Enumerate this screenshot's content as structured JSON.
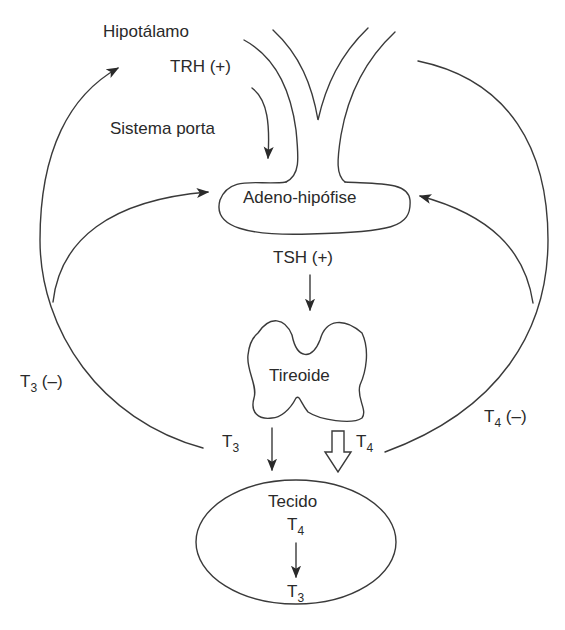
{
  "diagram": {
    "nodes": {
      "hypothalamus": {
        "label": "Hipotálamo"
      },
      "trh": {
        "label": "TRH (+)"
      },
      "portal_system": {
        "label": "Sistema porta"
      },
      "adenohypophysis": {
        "label": "Adeno-hipófise"
      },
      "tsh": {
        "label": "TSH (+)"
      },
      "thyroid": {
        "label": "Tireoide"
      },
      "tissue": {
        "label": "Tecido",
        "t4": {
          "base": "T",
          "sub": "4"
        },
        "t3": {
          "base": "T",
          "sub": "3"
        }
      }
    },
    "edges": {
      "t3_out": {
        "base": "T",
        "sub": "3"
      },
      "t4_out": {
        "base": "T",
        "sub": "4"
      },
      "t3_feedback": {
        "base": "T",
        "sub": "3",
        "sign": " (–)"
      },
      "t4_feedback": {
        "base": "T",
        "sub": "4",
        "sign": " (–)"
      }
    },
    "colors": {
      "line": "#3a3a3a",
      "text": "#2a2a2a",
      "background": "#ffffff"
    }
  }
}
